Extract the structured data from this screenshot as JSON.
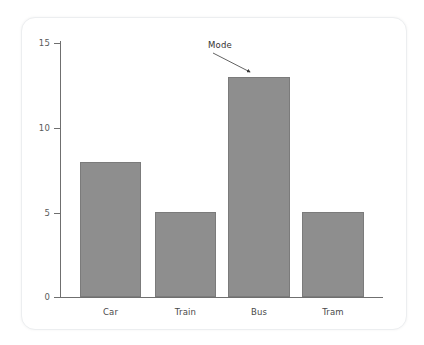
{
  "chart_data": {
    "type": "bar",
    "title": "",
    "subtitle": "",
    "xlabel": "",
    "ylabel": "",
    "categories": [
      "Car",
      "Train",
      "Bus",
      "Tram"
    ],
    "values": [
      8,
      5,
      13,
      5
    ],
    "series": [
      {
        "name": "count",
        "values": [
          8,
          5,
          13,
          5
        ]
      }
    ],
    "ylim": [
      0,
      15
    ],
    "yticks": [
      0,
      5,
      10,
      15
    ],
    "ytick_labels": [
      "0",
      "5",
      "10",
      "15"
    ],
    "grid": false,
    "legend": false,
    "legend_position": "none",
    "bar_color": "#8e8e8e",
    "bar_edge_color": "#7b7b7b",
    "axis_color": "#6f6f6f",
    "background_color": "#ffffff",
    "annotations": [
      {
        "text": "Mode",
        "target_category": "Bus",
        "target_value": 13,
        "arrow": true
      }
    ]
  },
  "figure": {
    "card_background": "#ffffff",
    "card_border": "#eceef0"
  }
}
